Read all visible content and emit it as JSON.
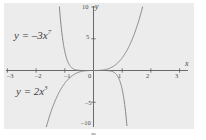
{
  "chart_data": {
    "type": "line",
    "title": "",
    "xlabel": "x",
    "ylabel": "y",
    "xlim": [
      -3.4,
      3.4
    ],
    "ylim": [
      -11,
      11
    ],
    "grid": false,
    "legend_position": "inline-annotations",
    "background_color": "#ececec",
    "axis_color": "#5a5a5a",
    "curve_color": "#7d7d7d",
    "xticks": [
      {
        "value": -3,
        "label": "–3"
      },
      {
        "value": -2,
        "label": "–2"
      },
      {
        "value": -1,
        "label": "–1"
      },
      {
        "value": 0,
        "label": "0"
      },
      {
        "value": 1,
        "label": "1"
      },
      {
        "value": 2,
        "label": "2"
      },
      {
        "value": 3,
        "label": "3"
      }
    ],
    "yticks": [
      {
        "value": 10,
        "label": "10"
      },
      {
        "value": 5,
        "label": "5"
      },
      {
        "value": -5,
        "label": "–5"
      },
      {
        "value": -10,
        "label": "–10"
      }
    ],
    "series": [
      {
        "name": "y = 2x^3",
        "equation": "y = 2x³",
        "coefficient": 2,
        "exponent": 3,
        "label_base": "y = 2x",
        "label_exponent": "3",
        "points": [
          {
            "x": -1.71,
            "y": -10
          },
          {
            "x": -1.6,
            "y": -8.19
          },
          {
            "x": -1.4,
            "y": -5.49
          },
          {
            "x": -1.2,
            "y": -3.46
          },
          {
            "x": -1.0,
            "y": -2.0
          },
          {
            "x": -0.8,
            "y": -1.02
          },
          {
            "x": -0.6,
            "y": -0.43
          },
          {
            "x": -0.4,
            "y": -0.13
          },
          {
            "x": -0.2,
            "y": -0.016
          },
          {
            "x": 0,
            "y": 0
          },
          {
            "x": 0.2,
            "y": 0.016
          },
          {
            "x": 0.4,
            "y": 0.13
          },
          {
            "x": 0.6,
            "y": 0.43
          },
          {
            "x": 0.8,
            "y": 1.02
          },
          {
            "x": 1.0,
            "y": 2.0
          },
          {
            "x": 1.2,
            "y": 3.46
          },
          {
            "x": 1.4,
            "y": 5.49
          },
          {
            "x": 1.6,
            "y": 8.19
          },
          {
            "x": 1.71,
            "y": 10
          }
        ]
      },
      {
        "name": "y = -3x^7",
        "equation": "y = –3x⁷",
        "coefficient": -3,
        "exponent": 7,
        "label_base": "y = –3x",
        "label_exponent": "7",
        "points": [
          {
            "x": -1.2,
            "y": 10.75
          },
          {
            "x": -1.18,
            "y": 9.8
          },
          {
            "x": -1.1,
            "y": 5.78
          },
          {
            "x": -1.05,
            "y": 4.15
          },
          {
            "x": -1.0,
            "y": 3.0
          },
          {
            "x": -0.95,
            "y": 2.13
          },
          {
            "x": -0.9,
            "y": 1.43
          },
          {
            "x": -0.8,
            "y": 0.63
          },
          {
            "x": -0.7,
            "y": 0.25
          },
          {
            "x": -0.6,
            "y": 0.084
          },
          {
            "x": -0.4,
            "y": 0.005
          },
          {
            "x": -0.2,
            "y": 4e-05
          },
          {
            "x": 0,
            "y": 0
          },
          {
            "x": 0.2,
            "y": -4e-05
          },
          {
            "x": 0.4,
            "y": -0.005
          },
          {
            "x": 0.6,
            "y": -0.084
          },
          {
            "x": 0.7,
            "y": -0.25
          },
          {
            "x": 0.8,
            "y": -0.63
          },
          {
            "x": 0.9,
            "y": -1.43
          },
          {
            "x": 0.95,
            "y": -2.13
          },
          {
            "x": 1.0,
            "y": -3.0
          },
          {
            "x": 1.05,
            "y": -4.15
          },
          {
            "x": 1.1,
            "y": -5.78
          },
          {
            "x": 1.18,
            "y": -9.8
          },
          {
            "x": 1.2,
            "y": -10.75
          }
        ]
      }
    ],
    "annotations": [
      {
        "text": "y = –3x⁷",
        "base": "y = –3x",
        "exponent": "7",
        "x": -2.45,
        "y": 6.1
      },
      {
        "text": "y = 2x³",
        "base": "y = 2x",
        "exponent": "3",
        "x": -2.35,
        "y": -4.6
      }
    ]
  }
}
